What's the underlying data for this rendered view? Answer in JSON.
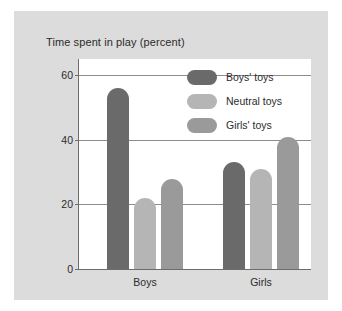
{
  "figure": {
    "background_color": "#dcdcdc",
    "plot_background_color": "#ffffff",
    "axis_color": "#6d6d6d",
    "grid_color": "#8d8d8d"
  },
  "chart_data": {
    "type": "bar",
    "title": "Time spent in play (percent)",
    "xlabel": "",
    "ylabel": "",
    "categories": [
      "Boys",
      "Girls"
    ],
    "series": [
      {
        "name": "Boys' toys",
        "color": "#6a6a6a",
        "values": [
          56,
          33
        ]
      },
      {
        "name": "Neutral toys",
        "color": "#b5b5b5",
        "values": [
          22,
          31
        ]
      },
      {
        "name": "Girls' toys",
        "color": "#9a9a9a",
        "values": [
          28,
          41
        ]
      }
    ],
    "ylim": [
      0,
      65
    ],
    "yticks": [
      0,
      20,
      40,
      60
    ],
    "ytick_labels": [
      "0",
      "20",
      "40",
      "60"
    ],
    "grid": true,
    "grid_axis": "y",
    "legend_position": "upper-right-inside"
  }
}
